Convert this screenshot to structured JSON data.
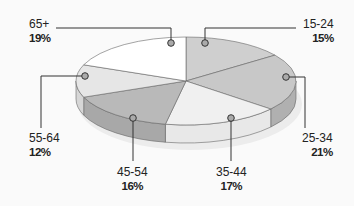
{
  "chart_data": {
    "type": "pie",
    "style": "3d",
    "title": "",
    "categories": [
      "15-24",
      "25-34",
      "35-44",
      "45-54",
      "55-64",
      "65+"
    ],
    "values": [
      15,
      21,
      17,
      16,
      12,
      19
    ],
    "labels": [
      {
        "category": "15-24",
        "percent": "15%"
      },
      {
        "category": "25-34",
        "percent": "21%"
      },
      {
        "category": "35-44",
        "percent": "17%"
      },
      {
        "category": "45-54",
        "percent": "16%"
      },
      {
        "category": "55-64",
        "percent": "12%"
      },
      {
        "category": "65+",
        "percent": "19%"
      }
    ],
    "colors": [
      "#cfcfcf",
      "#c8c8c8",
      "#f0f0f0",
      "#b9b9b9",
      "#e6e6e6",
      "#ffffff"
    ],
    "side_colors": [
      "#b5b5b5",
      "#b0b0b0",
      "#e8e8e8",
      "#a8a8a8",
      "#d6d6d6",
      "#f2f2f2"
    ],
    "legend": "callout labels"
  }
}
